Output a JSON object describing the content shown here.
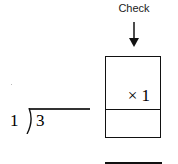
{
  "check": {
    "label": "Check",
    "arrow_icon": "arrow-down-icon"
  },
  "check_box": {
    "multiplier_text": "× 1",
    "bottom_cell_value": ""
  },
  "long_division": {
    "divisor": "1",
    "dividend": "3",
    "quotient": ""
  },
  "colors": {
    "stroke": "#111111",
    "background": "#ffffff"
  }
}
